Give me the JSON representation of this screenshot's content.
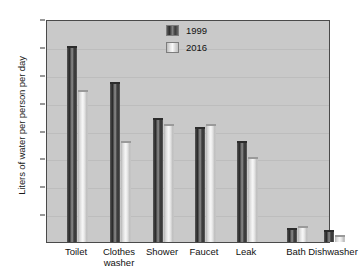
{
  "chart_data": {
    "type": "bar",
    "title": "",
    "xlabel": "",
    "ylabel": "Liters of water per person per day",
    "categories": [
      "Toilet",
      "Clothes\nwasher",
      "Shower",
      "Faucet",
      "Leak",
      "Bath",
      "Dishwasher"
    ],
    "series": [
      {
        "name": "1999",
        "color": "#3a3a3a",
        "values": [
          70,
          57,
          44,
          41,
          36,
          4.5,
          4
        ]
      },
      {
        "name": "2016",
        "color": "#e8e8e8",
        "values": [
          54,
          36,
          42,
          42,
          30,
          5.5,
          2
        ]
      }
    ],
    "ylim": [
      0,
      80
    ],
    "yticks": [
      10,
      20,
      30,
      40,
      50,
      60,
      70,
      80
    ],
    "grid": true,
    "legend_position": "top-center"
  },
  "legend": {
    "items": [
      {
        "label": "1999",
        "swatch": "dark-gradient-bar-swatch"
      },
      {
        "label": "2016",
        "swatch": "light-gradient-bar-swatch"
      }
    ]
  },
  "bleed": {
    "top": "",
    "bottom": ""
  }
}
